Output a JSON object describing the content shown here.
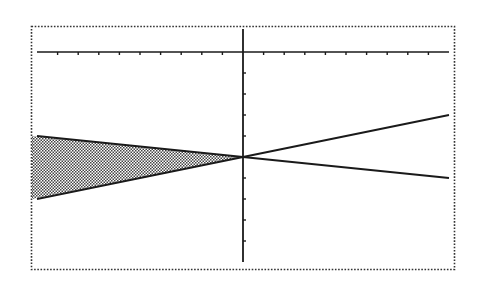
{
  "chart_data": {
    "type": "line",
    "title": "",
    "xlabel": "",
    "ylabel": "",
    "xlim": [
      -10,
      10
    ],
    "ylim": [
      -10,
      1
    ],
    "xscale": 1,
    "yscale": 1,
    "grid": false,
    "legend": null,
    "series": [
      {
        "name": "Y1",
        "equation": "y = -0.1x - 5",
        "x": [
          -10,
          0,
          10
        ],
        "y": [
          -4,
          -5,
          -6
        ]
      },
      {
        "name": "Y2",
        "equation": "y = 0.2x - 5",
        "x": [
          -10,
          0,
          10
        ],
        "y": [
          -7,
          -5,
          -3
        ]
      }
    ],
    "shading": {
      "between": [
        "Y1",
        "Y2"
      ],
      "x_range": [
        -10,
        0
      ],
      "pattern": "checker-dots"
    },
    "intersection": {
      "x": 0,
      "y": -5
    }
  },
  "colors": {
    "background": "#ffffff",
    "ink": "#1a1a1a",
    "border": "#333333",
    "shade": "#555555"
  }
}
